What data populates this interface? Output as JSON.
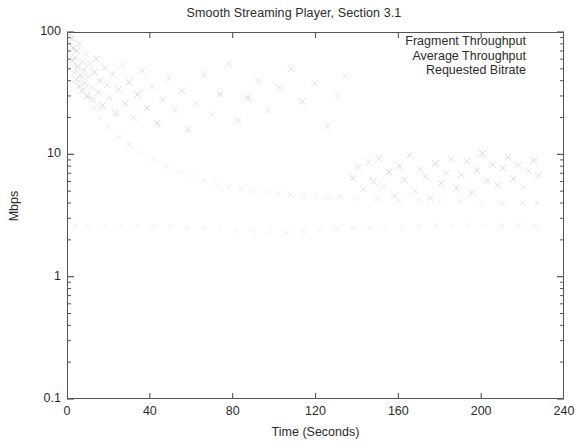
{
  "chart_data": {
    "type": "scatter",
    "title": "Smooth Streaming Player, Section 3.1",
    "xlabel": "Time (Seconds)",
    "ylabel": "Mbps",
    "xlim": [
      0,
      240
    ],
    "ylim": [
      0.1,
      100
    ],
    "yscale": "log",
    "xscale": "linear",
    "grid": false,
    "legend_position": "top-right",
    "xticks": [
      "0",
      "40",
      "80",
      "120",
      "160",
      "200",
      "240"
    ],
    "xtick_values": [
      0,
      40,
      80,
      120,
      160,
      200,
      240
    ],
    "yticks": [
      "0.1",
      "1",
      "10",
      "100"
    ],
    "ytick_values": [
      0.1,
      1,
      10,
      100
    ],
    "marker_color": "#b9b9bd",
    "axis_color": "#555555",
    "series": [
      {
        "name": "Fragment Throughput",
        "marker": "x",
        "points": [
          [
            1.5,
            96
          ],
          [
            2.2,
            88
          ],
          [
            2.6,
            58
          ],
          [
            3.0,
            74
          ],
          [
            3.4,
            46
          ],
          [
            3.9,
            62
          ],
          [
            4.3,
            41
          ],
          [
            4.8,
            70
          ],
          [
            5.2,
            52
          ],
          [
            5.7,
            36
          ],
          [
            6.1,
            80
          ],
          [
            6.6,
            44
          ],
          [
            7.0,
            33
          ],
          [
            7.5,
            57
          ],
          [
            8.0,
            49
          ],
          [
            8.6,
            38
          ],
          [
            9.1,
            66
          ],
          [
            9.7,
            30
          ],
          [
            10.3,
            43
          ],
          [
            11.0,
            55
          ],
          [
            11.8,
            35
          ],
          [
            12.5,
            28
          ],
          [
            13.3,
            47
          ],
          [
            14.2,
            60
          ],
          [
            15.0,
            32
          ],
          [
            16.0,
            40
          ],
          [
            17.1,
            25
          ],
          [
            18.2,
            51
          ],
          [
            19.4,
            37
          ],
          [
            20.6,
            29
          ],
          [
            22.0,
            45
          ],
          [
            23.4,
            22
          ],
          [
            24.9,
            34
          ],
          [
            26.5,
            54
          ],
          [
            28.1,
            26
          ],
          [
            30.0,
            39
          ],
          [
            32.0,
            20
          ],
          [
            34.1,
            31
          ],
          [
            36.3,
            48
          ],
          [
            38.6,
            24
          ],
          [
            41.0,
            36
          ],
          [
            43.6,
            18
          ],
          [
            46.3,
            28
          ],
          [
            49.2,
            42
          ],
          [
            52.2,
            23
          ],
          [
            55.4,
            33
          ],
          [
            58.7,
            16
          ],
          [
            62.2,
            26
          ],
          [
            65.9,
            45
          ],
          [
            69.8,
            21
          ],
          [
            73.9,
            31
          ],
          [
            78.2,
            55
          ],
          [
            82.6,
            19
          ],
          [
            87.3,
            29
          ],
          [
            92.2,
            40
          ],
          [
            97.3,
            23
          ],
          [
            102.6,
            35
          ],
          [
            108.1,
            50
          ],
          [
            113.8,
            27
          ],
          [
            119.7,
            38
          ],
          [
            125.8,
            17
          ],
          [
            131.0,
            30
          ],
          [
            134.5,
            44
          ],
          [
            138.0,
            6.4
          ],
          [
            140.5,
            7.8
          ],
          [
            143.0,
            5.2
          ],
          [
            145.5,
            8.6
          ],
          [
            148.0,
            6.0
          ],
          [
            150.5,
            9.3
          ],
          [
            153.0,
            5.5
          ],
          [
            155.5,
            7.2
          ],
          [
            158.0,
            4.6
          ],
          [
            160.5,
            8.0
          ],
          [
            163.0,
            6.2
          ],
          [
            165.5,
            9.8
          ],
          [
            168.0,
            5.0
          ],
          [
            170.5,
            7.5
          ],
          [
            173.0,
            6.6
          ],
          [
            175.5,
            4.4
          ],
          [
            178.0,
            8.4
          ],
          [
            180.5,
            5.8
          ],
          [
            183.0,
            7.0
          ],
          [
            185.5,
            9.1
          ],
          [
            188.0,
            5.3
          ],
          [
            190.5,
            6.8
          ],
          [
            193.0,
            8.8
          ],
          [
            195.5,
            4.9
          ],
          [
            198.0,
            7.4
          ],
          [
            200.5,
            10.2
          ],
          [
            203.0,
            6.1
          ],
          [
            205.5,
            8.2
          ],
          [
            208.0,
            5.6
          ],
          [
            210.5,
            7.7
          ],
          [
            213.0,
            9.5
          ],
          [
            215.5,
            6.3
          ],
          [
            218.0,
            8.1
          ],
          [
            220.5,
            5.4
          ],
          [
            223.0,
            7.3
          ],
          [
            225.5,
            8.9
          ],
          [
            227.5,
            6.7
          ]
        ]
      },
      {
        "name": "Average Throughput",
        "marker": "x",
        "points": [
          [
            2.0,
            62
          ],
          [
            4.0,
            48
          ],
          [
            6.0,
            40
          ],
          [
            8.0,
            34
          ],
          [
            10.0,
            29
          ],
          [
            13.0,
            24
          ],
          [
            16.0,
            20
          ],
          [
            20.0,
            17
          ],
          [
            25.0,
            14
          ],
          [
            30.0,
            12
          ],
          [
            36.0,
            10.2
          ],
          [
            42.0,
            9.0
          ],
          [
            48.0,
            8.0
          ],
          [
            54.0,
            7.2
          ],
          [
            60.0,
            6.6
          ],
          [
            66.0,
            6.1
          ],
          [
            72.0,
            5.7
          ],
          [
            78.0,
            5.4
          ],
          [
            84.0,
            5.2
          ],
          [
            90.0,
            5.0
          ],
          [
            96.0,
            4.9
          ],
          [
            102.0,
            4.8
          ],
          [
            108.0,
            4.7
          ],
          [
            114.0,
            4.6
          ],
          [
            120.0,
            4.6
          ],
          [
            126.0,
            4.5
          ],
          [
            132.0,
            4.5
          ],
          [
            140.0,
            4.4
          ],
          [
            150.0,
            4.3
          ],
          [
            160.0,
            4.2
          ],
          [
            170.0,
            4.2
          ],
          [
            180.0,
            4.1
          ],
          [
            190.0,
            4.1
          ],
          [
            200.0,
            4.0
          ],
          [
            210.0,
            4.0
          ],
          [
            220.0,
            4.0
          ],
          [
            227.0,
            4.0
          ]
        ]
      },
      {
        "name": "Requested Bitrate",
        "marker": "x",
        "points": [
          [
            4.0,
            2.6
          ],
          [
            10.0,
            2.6
          ],
          [
            18.0,
            2.6
          ],
          [
            26.0,
            2.6
          ],
          [
            34.0,
            2.6
          ],
          [
            42.0,
            2.55
          ],
          [
            50.0,
            2.55
          ],
          [
            58.0,
            2.5
          ],
          [
            66.0,
            2.5
          ],
          [
            74.0,
            2.45
          ],
          [
            82.0,
            2.4
          ],
          [
            90.0,
            2.35
          ],
          [
            98.0,
            2.3
          ],
          [
            106.0,
            2.3
          ],
          [
            114.0,
            2.35
          ],
          [
            122.0,
            2.4
          ],
          [
            130.0,
            2.45
          ],
          [
            138.0,
            2.5
          ],
          [
            146.0,
            2.5
          ],
          [
            154.0,
            2.55
          ],
          [
            162.0,
            2.55
          ],
          [
            170.0,
            2.55
          ],
          [
            178.0,
            2.6
          ],
          [
            186.0,
            2.6
          ],
          [
            194.0,
            2.6
          ],
          [
            202.0,
            2.6
          ],
          [
            210.0,
            2.6
          ],
          [
            218.0,
            2.6
          ],
          [
            226.0,
            2.6
          ]
        ]
      }
    ]
  },
  "legend": {
    "entries": [
      "Fragment Throughput",
      "Average Throughput",
      "Requested Bitrate"
    ]
  }
}
